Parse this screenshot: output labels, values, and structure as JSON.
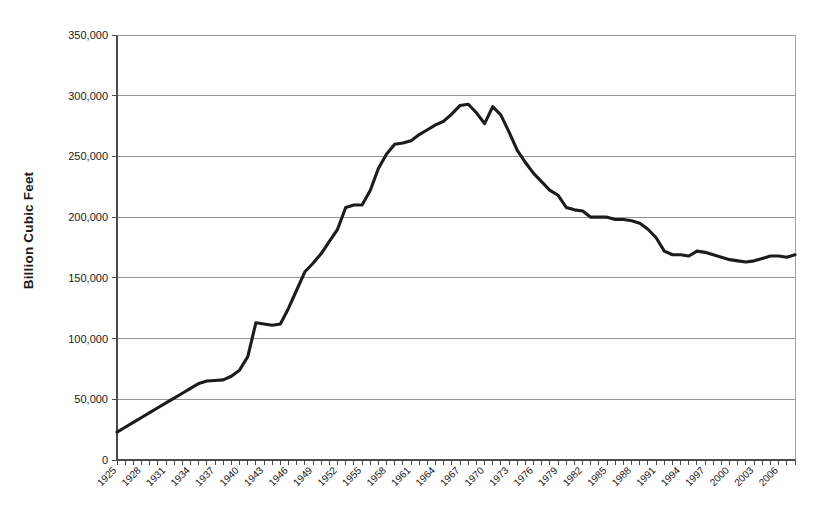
{
  "chart_data": {
    "type": "line",
    "title": "",
    "subtitle": "",
    "xlabel": "",
    "ylabel": "Billion Cubic Feet",
    "xlim": [
      1925,
      2008
    ],
    "ylim": [
      0,
      350000
    ],
    "grid": "horizontal",
    "legend": "none",
    "y_ticks": [
      0,
      50000,
      100000,
      150000,
      200000,
      250000,
      300000,
      350000
    ],
    "y_tick_labels": [
      "0",
      "50,000",
      "100,000",
      "150,000",
      "200,000",
      "250,000",
      "300,000",
      "350,000"
    ],
    "x_tick_labels": [
      "1925",
      "1928",
      "1931",
      "1934",
      "1937",
      "1940",
      "1943",
      "1946",
      "1949",
      "1952",
      "1955",
      "1958",
      "1961",
      "1964",
      "1967",
      "1970",
      "1973",
      "1976",
      "1979",
      "1982",
      "1985",
      "1988",
      "1991",
      "1994",
      "1997",
      "2000",
      "2003",
      "2006"
    ],
    "x_tick_label_interval": 3,
    "line_color": "#1c1c1c",
    "series": [
      {
        "name": "Billion Cubic Feet",
        "x": [
          1925,
          1926,
          1927,
          1928,
          1929,
          1930,
          1931,
          1932,
          1933,
          1934,
          1935,
          1936,
          1937,
          1938,
          1939,
          1940,
          1941,
          1942,
          1943,
          1944,
          1945,
          1946,
          1947,
          1948,
          1949,
          1950,
          1951,
          1952,
          1953,
          1954,
          1955,
          1956,
          1957,
          1958,
          1959,
          1960,
          1961,
          1962,
          1963,
          1964,
          1965,
          1966,
          1967,
          1968,
          1969,
          1970,
          1971,
          1972,
          1973,
          1974,
          1975,
          1976,
          1977,
          1978,
          1979,
          1980,
          1981,
          1982,
          1983,
          1984,
          1985,
          1986,
          1987,
          1988,
          1989,
          1990,
          1991,
          1992,
          1993,
          1994,
          1995,
          1996,
          1997,
          1998,
          1999,
          2000,
          2001,
          2002,
          2003,
          2004,
          2005,
          2006,
          2007,
          2008
        ],
        "values": [
          23000,
          27000,
          31000,
          35000,
          39000,
          43000,
          47000,
          51000,
          55000,
          59000,
          63000,
          65000,
          65500,
          66000,
          69000,
          74000,
          85000,
          113000,
          112000,
          111000,
          112000,
          125000,
          140000,
          155000,
          162000,
          170000,
          180000,
          190000,
          208000,
          210000,
          210000,
          222000,
          240000,
          252000,
          260000,
          261000,
          263000,
          268000,
          272000,
          276000,
          279000,
          285000,
          292000,
          293000,
          286000,
          277000,
          291000,
          284000,
          270000,
          255000,
          245000,
          236000,
          229000,
          222000,
          218000,
          208000,
          206000,
          205000,
          200000,
          200000,
          200000,
          198000,
          198000,
          197000,
          195000,
          190000,
          183000,
          172000,
          169000,
          169000,
          168000,
          172000,
          171000,
          169000,
          167000,
          165000,
          164000,
          163000,
          164000,
          166000,
          168000,
          168000,
          167000,
          169000
        ]
      }
    ]
  },
  "axis": {
    "y_label": "Billion Cubic Feet"
  }
}
